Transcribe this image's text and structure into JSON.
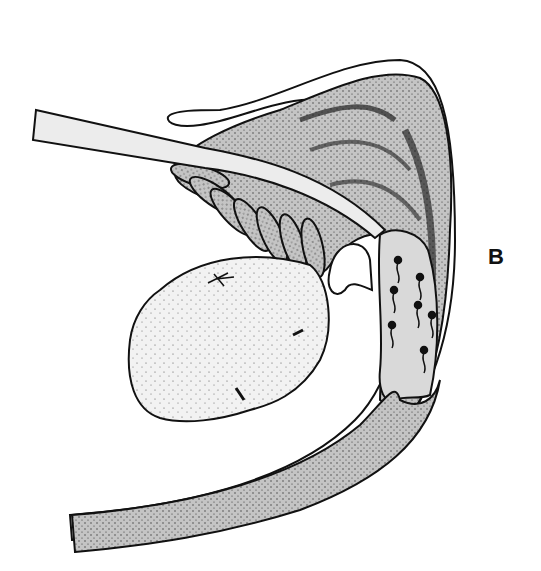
{
  "figure": {
    "type": "anatomical-illustration",
    "style": "black-and-white stippled line drawing",
    "panel_label": "B",
    "structures": [
      "cannula-tube",
      "duct-wrapped-tubules",
      "outer-sheath",
      "ovoid-mass",
      "sperm-filled-chamber",
      "curved-duct"
    ],
    "colors": {
      "ink": "#111111",
      "stipple_fill": "#bdbdbd",
      "light_fill": "#ececec",
      "paper": "#ffffff"
    }
  }
}
